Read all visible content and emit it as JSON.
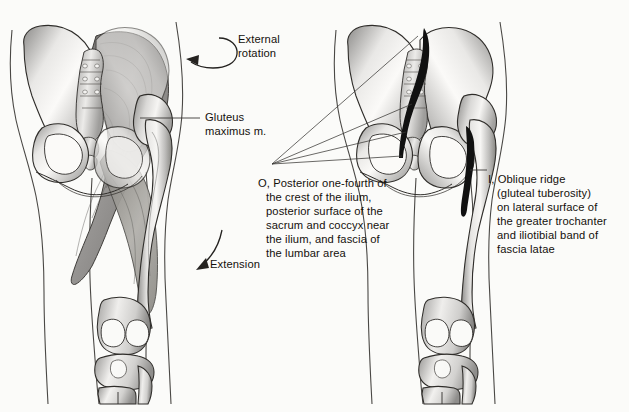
{
  "figure": {
    "background_color": "#fbfbf9",
    "ink_color": "#14100c",
    "bone_light": "#f2f1ef",
    "bone_mid": "#b9b8b6",
    "bone_dark": "#7a7977",
    "muscle_mid": "#9a9896",
    "muscle_dark": "#6e6c6a",
    "mark_color": "#111111"
  },
  "labels": {
    "external_rotation": "External\nrotation",
    "gluteus_maximus": "Gluteus\nmaximus m.",
    "extension": "Extension",
    "origin": {
      "prefix": "O, ",
      "line1": "Posterior one-fourth of",
      "rest": "the crest of the ilium,\nposterior surface of the\nsacrum and coccyx near\nthe ilium, and fascia of\nthe lumbar area",
      "full": "O, Posterior one-fourth of the crest of the ilium, posterior surface of the sacrum and coccyx near the ilium, and fascia of the lumbar area"
    },
    "insertion": {
      "prefix": "I, ",
      "line1": "Oblique ridge",
      "rest": "(gluteal tuberosity)\non lateral surface of\nthe greater trochanter\nand iliotibial band of\nfascia latae",
      "full": "I, Oblique ridge (gluteal tuberosity) on lateral surface of the greater trochanter and iliotibial band of fascia latae"
    }
  },
  "panels": {
    "left": {
      "name": "muscle-view",
      "description": "Posterior pelvis and thigh with gluteus maximus muscle shaded"
    },
    "right": {
      "name": "attachment-view",
      "description": "Posterior pelvis and thigh skeleton with origin and insertion marked in black"
    }
  }
}
